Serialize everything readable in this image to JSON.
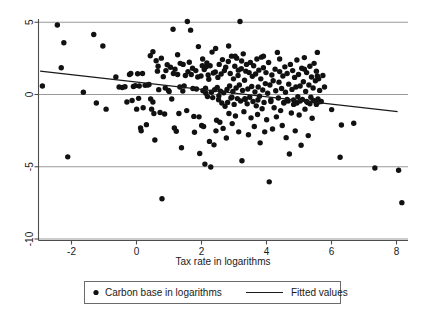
{
  "chart_data": {
    "type": "scatter",
    "title": "",
    "xlabel": "Tax rate in logarithms",
    "ylabel": "",
    "xlim": [
      -3.15,
      8.4
    ],
    "ylim": [
      -10.2,
      5.4
    ],
    "xticks": [
      -2,
      0,
      2,
      4,
      6,
      8
    ],
    "xtick_labels": [
      "-2",
      "0",
      "2",
      "4",
      "6",
      "8"
    ],
    "yticks": [
      5,
      0,
      -5,
      -10
    ],
    "ytick_labels": [
      "5",
      "0",
      "-5",
      "-10"
    ],
    "grid": "horizontal gridlines at y = 5, 0, -5, -10",
    "legend_position": "below-axis-centered",
    "series": [
      {
        "name": "Carbon base in logarithms",
        "type": "scatter",
        "marker": "filled-circle",
        "color": "#111111",
        "points": [
          [
            -2.88,
            0.55
          ],
          [
            -2.42,
            4.78
          ],
          [
            -2.3,
            1.82
          ],
          [
            -2.22,
            3.55
          ],
          [
            -2.1,
            -4.35
          ],
          [
            -1.62,
            0.12
          ],
          [
            -1.3,
            4.12
          ],
          [
            -1.22,
            -0.62
          ],
          [
            -1.02,
            3.32
          ],
          [
            -0.92,
            -1.05
          ],
          [
            -0.62,
            1.18
          ],
          [
            -0.52,
            0.48
          ],
          [
            -0.42,
            0.45
          ],
          [
            -0.34,
            0.5
          ],
          [
            -0.28,
            -0.55
          ],
          [
            -0.2,
            1.35
          ],
          [
            -0.16,
            1.42
          ],
          [
            -0.12,
            -0.45
          ],
          [
            -0.08,
            0.52
          ],
          [
            -0.02,
            0.58
          ],
          [
            0.02,
            -1.05
          ],
          [
            0.05,
            1.4
          ],
          [
            0.08,
            -0.3
          ],
          [
            0.1,
            0.55
          ],
          [
            0.14,
            -2.35
          ],
          [
            0.16,
            -2.55
          ],
          [
            0.2,
            1.42
          ],
          [
            0.22,
            -0.95
          ],
          [
            0.28,
            0.6
          ],
          [
            0.32,
            -2.12
          ],
          [
            0.36,
            0.62
          ],
          [
            0.4,
            0.66
          ],
          [
            0.44,
            2.65
          ],
          [
            0.48,
            -1.05
          ],
          [
            0.52,
            -0.55
          ],
          [
            0.55,
            -1.35
          ],
          [
            0.58,
            -3.18
          ],
          [
            0.62,
            2.3
          ],
          [
            0.66,
            1.58
          ],
          [
            0.7,
            0.3
          ],
          [
            0.74,
            -1.28
          ],
          [
            0.78,
            2.48
          ],
          [
            0.8,
            -7.25
          ],
          [
            0.84,
            1.2
          ],
          [
            0.88,
            -1.38
          ],
          [
            0.92,
            1.62
          ],
          [
            0.96,
            2.02
          ],
          [
            1.0,
            0.25
          ],
          [
            1.02,
            0.18
          ],
          [
            1.06,
            1.85
          ],
          [
            1.1,
            -0.35
          ],
          [
            1.14,
            4.48
          ],
          [
            1.18,
            -2.35
          ],
          [
            1.2,
            1.72
          ],
          [
            1.24,
            -2.58
          ],
          [
            1.28,
            1.35
          ],
          [
            1.32,
            -1.35
          ],
          [
            1.36,
            2.12
          ],
          [
            1.4,
            -3.72
          ],
          [
            1.44,
            0.2
          ],
          [
            1.48,
            0.55
          ],
          [
            1.52,
            1.28
          ],
          [
            1.56,
            -1.15
          ],
          [
            1.58,
            5.02
          ],
          [
            1.6,
            1.55
          ],
          [
            1.64,
            2.2
          ],
          [
            1.68,
            4.42
          ],
          [
            1.7,
            1.35
          ],
          [
            1.74,
            1.78
          ],
          [
            1.78,
            -1.55
          ],
          [
            1.8,
            -2.65
          ],
          [
            1.84,
            1.62
          ],
          [
            1.86,
            0.35
          ],
          [
            1.9,
            1.18
          ],
          [
            1.94,
            -1.58
          ],
          [
            1.96,
            -4.12
          ],
          [
            2.0,
            1.25
          ],
          [
            2.02,
            -2.18
          ],
          [
            2.04,
            1.95
          ],
          [
            2.06,
            0.22
          ],
          [
            2.08,
            -2.25
          ],
          [
            2.1,
            1.7
          ],
          [
            2.12,
            -4.85
          ],
          [
            2.14,
            0.4
          ],
          [
            2.16,
            1.88
          ],
          [
            2.18,
            2.15
          ],
          [
            2.2,
            -0.18
          ],
          [
            2.22,
            1.32
          ],
          [
            2.24,
            1.02
          ],
          [
            2.26,
            -3.28
          ],
          [
            2.28,
            1.95
          ],
          [
            2.3,
            -5.05
          ],
          [
            2.32,
            0.12
          ],
          [
            2.34,
            2.9
          ],
          [
            2.36,
            -0.25
          ],
          [
            2.38,
            1.45
          ],
          [
            2.4,
            -3.52
          ],
          [
            2.42,
            0.3
          ],
          [
            2.44,
            1.52
          ],
          [
            2.46,
            -2.55
          ],
          [
            2.48,
            -1.82
          ],
          [
            2.5,
            0.45
          ],
          [
            2.52,
            1.15
          ],
          [
            2.54,
            -0.4
          ],
          [
            2.56,
            2.05
          ],
          [
            2.58,
            -1.95
          ],
          [
            2.6,
            0.2
          ],
          [
            2.62,
            1.38
          ],
          [
            2.64,
            -0.62
          ],
          [
            2.66,
            2.38
          ],
          [
            2.68,
            -2.38
          ],
          [
            2.7,
            0.08
          ],
          [
            2.72,
            1.62
          ],
          [
            2.74,
            -0.85
          ],
          [
            2.76,
            1.85
          ],
          [
            2.78,
            -3.05
          ],
          [
            2.8,
            0.32
          ],
          [
            2.82,
            -0.58
          ],
          [
            2.84,
            2.25
          ],
          [
            2.86,
            -1.35
          ],
          [
            2.88,
            0.55
          ],
          [
            2.9,
            1.42
          ],
          [
            2.92,
            -0.28
          ],
          [
            2.94,
            2.62
          ],
          [
            2.96,
            -2.05
          ],
          [
            2.98,
            0.18
          ],
          [
            3.0,
            1.05
          ],
          [
            3.02,
            -0.72
          ],
          [
            3.04,
            1.92
          ],
          [
            3.06,
            -1.52
          ],
          [
            3.08,
            0.42
          ],
          [
            3.1,
            2.48
          ],
          [
            3.12,
            -0.32
          ],
          [
            3.14,
            1.28
          ],
          [
            3.16,
            -2.62
          ],
          [
            3.18,
            0.62
          ],
          [
            3.2,
            5.02
          ],
          [
            3.22,
            -0.48
          ],
          [
            3.24,
            1.75
          ],
          [
            3.26,
            -4.62
          ],
          [
            3.28,
            0.25
          ],
          [
            3.3,
            2.78
          ],
          [
            3.32,
            -1.22
          ],
          [
            3.34,
            0.95
          ],
          [
            3.36,
            -0.38
          ],
          [
            3.38,
            1.58
          ],
          [
            3.4,
            2.05
          ],
          [
            3.42,
            -0.68
          ],
          [
            3.44,
            0.35
          ],
          [
            3.46,
            -2.82
          ],
          [
            3.48,
            1.48
          ],
          [
            3.5,
            -0.22
          ],
          [
            3.52,
            2.18
          ],
          [
            3.54,
            -1.65
          ],
          [
            3.56,
            0.52
          ],
          [
            3.58,
            1.22
          ],
          [
            3.6,
            -0.52
          ],
          [
            3.62,
            1.95
          ],
          [
            3.64,
            -2.25
          ],
          [
            3.66,
            0.15
          ],
          [
            3.68,
            1.38
          ],
          [
            3.7,
            -0.82
          ],
          [
            3.72,
            2.42
          ],
          [
            3.74,
            -1.42
          ],
          [
            3.76,
            0.48
          ],
          [
            3.78,
            1.65
          ],
          [
            3.8,
            -0.15
          ],
          [
            3.82,
            -3.38
          ],
          [
            3.84,
            1.05
          ],
          [
            3.86,
            2.55
          ],
          [
            3.88,
            -1.02
          ],
          [
            3.9,
            0.28
          ],
          [
            3.92,
            1.82
          ],
          [
            3.94,
            -0.58
          ],
          [
            3.96,
            -2.62
          ],
          [
            3.98,
            0.72
          ],
          [
            4.0,
            1.48
          ],
          [
            4.02,
            -1.78
          ],
          [
            4.05,
            0.05
          ],
          [
            4.08,
            2.18
          ],
          [
            4.1,
            -6.08
          ],
          [
            4.12,
            0.62
          ],
          [
            4.15,
            -0.42
          ],
          [
            4.18,
            1.32
          ],
          [
            4.2,
            -2.42
          ],
          [
            4.22,
            0.92
          ],
          [
            4.25,
            -0.95
          ],
          [
            4.28,
            1.72
          ],
          [
            4.3,
            0.22
          ],
          [
            4.32,
            -1.58
          ],
          [
            4.35,
            2.88
          ],
          [
            4.38,
            -0.28
          ],
          [
            4.4,
            0.82
          ],
          [
            4.42,
            1.55
          ],
          [
            4.45,
            -1.15
          ],
          [
            4.48,
            0.38
          ],
          [
            4.5,
            -2.18
          ],
          [
            4.52,
            1.25
          ],
          [
            4.55,
            -0.62
          ],
          [
            4.58,
            1.88
          ],
          [
            4.6,
            0.12
          ],
          [
            4.62,
            -3.02
          ],
          [
            4.65,
            1.42
          ],
          [
            4.68,
            -0.48
          ],
          [
            4.7,
            0.68
          ],
          [
            4.72,
            -4.15
          ],
          [
            4.75,
            2.05
          ],
          [
            4.78,
            -1.32
          ],
          [
            4.8,
            0.32
          ],
          [
            4.82,
            1.62
          ],
          [
            4.85,
            -0.72
          ],
          [
            4.88,
            1.15
          ],
          [
            4.9,
            -2.55
          ],
          [
            4.92,
            0.48
          ],
          [
            4.95,
            2.35
          ],
          [
            4.98,
            -0.18
          ],
          [
            5.0,
            1.35
          ],
          [
            5.02,
            -1.45
          ],
          [
            5.05,
            0.55
          ],
          [
            5.08,
            -3.55
          ],
          [
            5.1,
            1.78
          ],
          [
            5.12,
            -0.38
          ],
          [
            5.15,
            0.85
          ],
          [
            5.18,
            2.52
          ],
          [
            5.2,
            -1.05
          ],
          [
            5.22,
            0.18
          ],
          [
            5.25,
            1.48
          ],
          [
            5.28,
            -0.58
          ],
          [
            5.3,
            -2.88
          ],
          [
            5.32,
            0.62
          ],
          [
            5.35,
            1.92
          ],
          [
            5.38,
            -0.22
          ],
          [
            5.4,
            1.18
          ],
          [
            5.42,
            -1.68
          ],
          [
            5.45,
            0.42
          ],
          [
            5.48,
            2.12
          ],
          [
            5.5,
            -0.48
          ],
          [
            5.52,
            0.92
          ],
          [
            5.55,
            1.58
          ],
          [
            5.58,
            2.88
          ],
          [
            5.6,
            -0.35
          ],
          [
            5.62,
            1.05
          ],
          [
            5.65,
            0.25
          ],
          [
            5.7,
            -0.52
          ],
          [
            5.75,
            1.28
          ],
          [
            5.8,
            0.48
          ],
          [
            6.02,
            -1.08
          ],
          [
            6.28,
            -4.38
          ],
          [
            6.32,
            -2.15
          ],
          [
            6.7,
            -2.02
          ],
          [
            7.35,
            -5.12
          ],
          [
            8.08,
            -5.28
          ],
          [
            8.18,
            -7.52
          ],
          [
            0.45,
            -0.35
          ],
          [
            0.9,
            0.42
          ],
          [
            1.35,
            0.48
          ],
          [
            1.75,
            0.38
          ],
          [
            2.15,
            0.05
          ],
          [
            2.55,
            -0.12
          ],
          [
            2.95,
            -0.22
          ],
          [
            3.35,
            -0.32
          ],
          [
            3.75,
            -0.42
          ],
          [
            4.15,
            -0.52
          ],
          [
            4.55,
            -0.58
          ],
          [
            4.95,
            -0.62
          ],
          [
            5.35,
            -0.68
          ],
          [
            5.55,
            -0.72
          ],
          [
            5.62,
            -0.55
          ],
          [
            5.45,
            -0.45
          ],
          [
            5.25,
            -0.52
          ],
          [
            5.05,
            -0.48
          ],
          [
            4.85,
            -0.42
          ],
          [
            4.65,
            -0.38
          ],
          [
            3.15,
            1.65
          ],
          [
            3.25,
            2.28
          ],
          [
            2.05,
            2.42
          ],
          [
            1.45,
            2.05
          ],
          [
            1.15,
            1.42
          ],
          [
            0.68,
            1.92
          ],
          [
            1.92,
            3.28
          ],
          [
            2.45,
            3.15
          ],
          [
            2.85,
            3.32
          ],
          [
            3.05,
            2.62
          ],
          [
            3.92,
            2.62
          ],
          [
            4.42,
            2.42
          ],
          [
            5.18,
            1.72
          ],
          [
            5.58,
            1.25
          ],
          [
            0.52,
            2.92
          ],
          [
            1.28,
            2.72
          ]
        ]
      },
      {
        "name": "Fitted values",
        "type": "line",
        "color": "#1a1a1a",
        "endpoints": [
          [
            -2.95,
            1.58
          ],
          [
            8.05,
            -1.22
          ]
        ],
        "slope": -0.254,
        "intercept": 0.83
      }
    ]
  },
  "axes": {
    "x_title": "Tax rate in logarithms",
    "x_tick_labels": [
      "-2",
      "0",
      "2",
      "4",
      "6",
      "8"
    ],
    "y_tick_labels": [
      "5",
      "0",
      "-5",
      "-10"
    ]
  },
  "legend": {
    "entries": [
      {
        "label": "Carbon base in logarithms",
        "marker": "dot"
      },
      {
        "label": "Fitted values",
        "marker": "line"
      }
    ]
  },
  "colors": {
    "point": "#111111",
    "fit_line": "#1a1a1a",
    "gridline": "#9a9a9a",
    "axis": "#4d4d4d",
    "legend_border": "#6b6b6b",
    "background": "#ffffff"
  }
}
